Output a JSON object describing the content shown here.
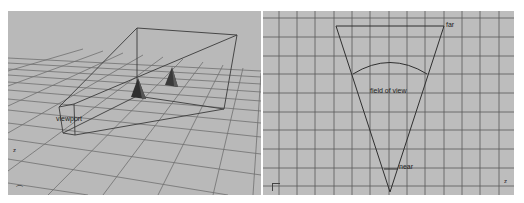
{
  "left_viewport": {
    "name": "perspective-view",
    "label_viewport": "viewport",
    "axis_label": "z",
    "colors": {
      "background": "#b9b9b9",
      "grid": "#6f6f6f",
      "frustum": "#3a3a3a",
      "cone": "#2e2e2e"
    }
  },
  "right_viewport": {
    "name": "top-view",
    "label_far": "far",
    "label_field_of_view": "field of view",
    "label_near": "near",
    "axis_label": "z",
    "colors": {
      "background": "#bdbdbd",
      "grid": "#5a5a5a",
      "frustum": "#333333"
    }
  }
}
